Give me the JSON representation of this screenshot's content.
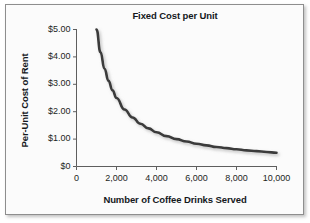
{
  "figure": {
    "background_color": "#fbfbfb",
    "border_color": "#8e8e8e"
  },
  "chart_data": {
    "type": "line",
    "title": "Fixed Cost per Unit",
    "xlabel": "Number of Coffee Drinks Served",
    "ylabel": "Per-Unit Cost of Rent",
    "grid": false,
    "legend": null,
    "line_color": "#3a3a3a",
    "line_width": 2.6,
    "xlim": [
      0,
      10600
    ],
    "ylim": [
      0,
      5.3
    ],
    "xticks": [
      0,
      2000,
      4000,
      6000,
      8000,
      10000
    ],
    "xtick_labels": [
      "0",
      "2,000",
      "4,000",
      "6,000",
      "8,000",
      "10,000"
    ],
    "yticks": [
      0,
      1,
      2,
      3,
      4,
      5
    ],
    "ytick_labels": [
      "$0",
      "$1.00",
      "$2.00",
      "$3.00",
      "$4.00",
      "$5.00"
    ],
    "annotation": "Total fixed rent of $5,000 divided by number of drinks served",
    "x": [
      1000,
      1200,
      1400,
      1600,
      1800,
      2000,
      2400,
      2800,
      3200,
      3600,
      4000,
      4500,
      5000,
      5500,
      6000,
      6500,
      7000,
      7500,
      8000,
      8500,
      9000,
      9500,
      10000
    ],
    "values": [
      5.0,
      4.17,
      3.57,
      3.13,
      2.78,
      2.5,
      2.08,
      1.79,
      1.56,
      1.39,
      1.25,
      1.11,
      1.0,
      0.91,
      0.83,
      0.77,
      0.71,
      0.67,
      0.63,
      0.59,
      0.56,
      0.53,
      0.5
    ],
    "series": [
      {
        "name": "Per-unit fixed cost of rent",
        "values": [
          5.0,
          4.17,
          3.57,
          3.13,
          2.78,
          2.5,
          2.08,
          1.79,
          1.56,
          1.39,
          1.25,
          1.11,
          1.0,
          0.91,
          0.83,
          0.77,
          0.71,
          0.67,
          0.63,
          0.59,
          0.56,
          0.53,
          0.5
        ]
      }
    ]
  }
}
